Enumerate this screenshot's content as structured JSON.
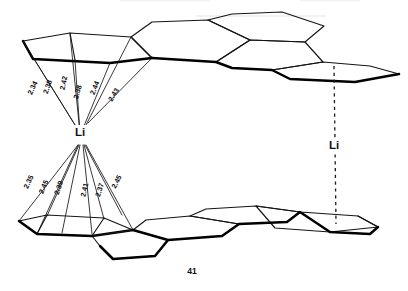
{
  "figure": {
    "name": "lithium-graphite-coordination",
    "page_number": "41",
    "atoms": [
      {
        "id": "li-left",
        "label": "Li",
        "x": 80,
        "y": 133
      },
      {
        "id": "li-right",
        "label": "Li",
        "x": 334,
        "y": 146
      }
    ],
    "upper_bonds": [
      {
        "label": "2.34",
        "x": 33,
        "y": 88,
        "rotate": -64
      },
      {
        "label": "2.38",
        "x": 48,
        "y": 87,
        "rotate": -70
      },
      {
        "label": "2.42",
        "x": 64,
        "y": 83,
        "rotate": -78
      },
      {
        "label": "2.38",
        "x": 78,
        "y": 92,
        "rotate": -74
      },
      {
        "label": "2.44",
        "x": 95,
        "y": 88,
        "rotate": -68
      },
      {
        "label": "2.43",
        "x": 114,
        "y": 95,
        "rotate": -58
      }
    ],
    "lower_bonds": [
      {
        "label": "2.35",
        "x": 29,
        "y": 182,
        "rotate": -64
      },
      {
        "label": "2.45",
        "x": 44,
        "y": 187,
        "rotate": -66
      },
      {
        "label": "2.39",
        "x": 59,
        "y": 188,
        "rotate": -70
      },
      {
        "label": "2.41",
        "x": 85,
        "y": 190,
        "rotate": -76
      },
      {
        "label": "2.37",
        "x": 100,
        "y": 190,
        "rotate": -72
      },
      {
        "label": "2.45",
        "x": 117,
        "y": 182,
        "rotate": -62
      }
    ],
    "axis": {
      "name": "li-stacking-axis",
      "style": "dashed",
      "x": 335,
      "y_top": 66,
      "y_bottom": 224
    },
    "colors": {
      "ink": "#151515",
      "bold_ink": "#000000",
      "background": "#ffffff"
    }
  }
}
